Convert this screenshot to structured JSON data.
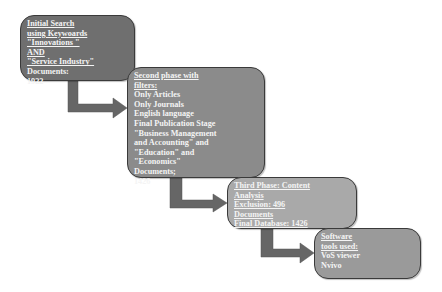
{
  "diagram": {
    "type": "step-flowchart",
    "boxes": [
      {
        "id": "initial-search",
        "lines": [
          {
            "text": "Initial Search",
            "underline": true
          },
          {
            "text": "using Keywoards",
            "underline": true
          },
          {
            "text": "\"Innovations \"",
            "underline": true
          },
          {
            "text": "AND",
            "underline": true
          },
          {
            "text": "\"Service Industry\"",
            "underline": true
          },
          {
            "text": "Documents:",
            "underline": false
          },
          {
            "text": "1922",
            "underline": false
          }
        ],
        "fill": "#6f6f6f"
      },
      {
        "id": "second-phase",
        "lines": [
          {
            "text": "Second phase with",
            "underline": true
          },
          {
            "text": "filters:",
            "underline": true
          },
          {
            "text": "Only Articles",
            "underline": false
          },
          {
            "text": "Only Journals",
            "underline": false
          },
          {
            "text": "English language",
            "underline": false
          },
          {
            "text": "Final Publication Stage",
            "underline": false
          },
          {
            "text": "\"Business Management",
            "underline": false
          },
          {
            "text": "and Accounting\" and",
            "underline": false
          },
          {
            "text": "\"Education\" and",
            "underline": false
          },
          {
            "text": "\"Economics\"",
            "underline": false
          },
          {
            "text": "Documents;",
            "underline": false
          },
          {
            "text": "1426",
            "underline": false
          }
        ],
        "fill": "#8b8b8b"
      },
      {
        "id": "third-phase",
        "lines": [
          {
            "text": "Third Phase: Content",
            "underline": true
          },
          {
            "text": "Analysis",
            "underline": true
          },
          {
            "text": "Exclusion: 496",
            "underline": true
          },
          {
            "text": "Documents",
            "underline": true
          },
          {
            "text": "Final Database: 1426",
            "underline": true
          }
        ],
        "fill": "#a9a9a9"
      },
      {
        "id": "software-tools",
        "lines": [
          {
            "text": "Software",
            "underline": true
          },
          {
            "text": "tools used:",
            "underline": true
          },
          {
            "text": "VoS viewer",
            "underline": false
          },
          {
            "text": "Nvivo",
            "underline": false
          }
        ],
        "fill": "#9a9a9a"
      }
    ],
    "arrow_color": "#6a6a6a",
    "edges": [
      {
        "from": "initial-search",
        "to": "second-phase"
      },
      {
        "from": "second-phase",
        "to": "third-phase"
      },
      {
        "from": "third-phase",
        "to": "software-tools"
      }
    ]
  }
}
